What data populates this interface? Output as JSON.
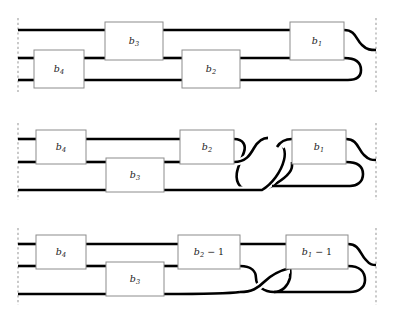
{
  "figure": {
    "title": "",
    "type": "braid-tangle-diagram",
    "background_color": "#ffffff",
    "strand_color": "#000000",
    "box_fill_color": "#ffffff",
    "box_border_color": "#8c8c8c",
    "boundary_color": "#9a9a9a",
    "boundary_style": "dashed-vertical",
    "strand_count": 3,
    "row_count": 3
  },
  "boundaries": {
    "left_x": 18,
    "right_x": 376,
    "name_left": "left-boundary-line",
    "name_right": "right-boundary-line"
  },
  "rows": [
    {
      "id": "row-1",
      "index": 1,
      "strand_y": [
        30,
        58,
        80
      ],
      "crossing_count": 0,
      "boxes": [
        {
          "id": "r1-b4",
          "label_base": "b",
          "label_sub": "4",
          "label_op": "",
          "x": 34,
          "y": 50,
          "w": 50,
          "h": 38,
          "spans": "strand-2-to-3"
        },
        {
          "id": "r1-b3",
          "label_base": "b",
          "label_sub": "3",
          "label_op": "",
          "x": 105,
          "y": 22,
          "w": 58,
          "h": 38,
          "spans": "strand-1-to-2"
        },
        {
          "id": "r1-b2",
          "label_base": "b",
          "label_sub": "2",
          "label_op": "",
          "x": 182,
          "y": 50,
          "w": 58,
          "h": 38,
          "spans": "strand-2-to-3"
        },
        {
          "id": "r1-b1",
          "label_base": "b",
          "label_sub": "1",
          "label_op": "",
          "x": 290,
          "y": 22,
          "w": 54,
          "h": 38,
          "spans": "strand-1-to-2"
        }
      ]
    },
    {
      "id": "row-2",
      "index": 2,
      "strand_y": [
        139,
        162,
        190
      ],
      "crossing_count": 2,
      "boxes": [
        {
          "id": "r2-b4",
          "label_base": "b",
          "label_sub": "4",
          "label_op": "",
          "x": 36,
          "y": 130,
          "w": 50,
          "h": 34,
          "spans": "strand-1-to-2"
        },
        {
          "id": "r2-b3",
          "label_base": "b",
          "label_sub": "3",
          "label_op": "",
          "x": 106,
          "y": 158,
          "w": 58,
          "h": 34,
          "spans": "strand-2-to-3"
        },
        {
          "id": "r2-b2",
          "label_base": "b",
          "label_sub": "2",
          "label_op": "",
          "x": 180,
          "y": 130,
          "w": 54,
          "h": 34,
          "spans": "strand-1-to-2"
        },
        {
          "id": "r2-b1",
          "label_base": "b",
          "label_sub": "1",
          "label_op": "",
          "x": 292,
          "y": 130,
          "w": 54,
          "h": 34,
          "spans": "strand-1-to-2"
        }
      ]
    },
    {
      "id": "row-3",
      "index": 3,
      "strand_y": [
        244,
        266,
        294
      ],
      "crossing_count": 1,
      "boxes": [
        {
          "id": "r3-b4",
          "label_base": "b",
          "label_sub": "4",
          "label_op": "",
          "x": 36,
          "y": 235,
          "w": 50,
          "h": 34,
          "spans": "strand-1-to-2"
        },
        {
          "id": "r3-b3",
          "label_base": "b",
          "label_sub": "3",
          "label_op": "",
          "x": 106,
          "y": 262,
          "w": 58,
          "h": 34,
          "spans": "strand-2-to-3"
        },
        {
          "id": "r3-b2m1",
          "label_base": "b",
          "label_sub": "2",
          "label_op": " − 1",
          "x": 178,
          "y": 235,
          "w": 62,
          "h": 34,
          "spans": "strand-1-to-2"
        },
        {
          "id": "r3-b1m1",
          "label_base": "b",
          "label_sub": "1",
          "label_op": " − 1",
          "x": 286,
          "y": 235,
          "w": 62,
          "h": 34,
          "spans": "strand-1-to-2"
        }
      ]
    }
  ],
  "labels": {
    "b1": "b₁",
    "b2": "b₂",
    "b3": "b₃",
    "b4": "b₄",
    "b1_minus_1": "b₁ − 1",
    "b2_minus_1": "b₂ − 1"
  }
}
